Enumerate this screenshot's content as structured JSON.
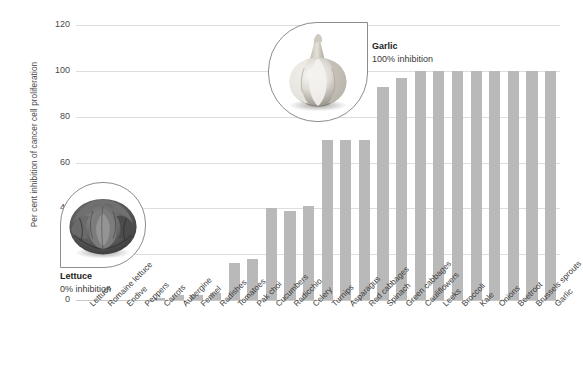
{
  "chart_data": {
    "type": "bar",
    "title": "",
    "xlabel": "",
    "ylabel": "Per cent inhibition of cancer cell proliferation",
    "ylim": [
      0,
      120
    ],
    "yticks": [
      0,
      20,
      40,
      60,
      80,
      100,
      120
    ],
    "grid": true,
    "legend": false,
    "bar_color": "#b9b9b9",
    "categories": [
      "Lettuce",
      "Romaine lettuce",
      "Endive",
      "Peppers",
      "Carrots",
      "Aubergine",
      "Fennel",
      "Radishes",
      "Tomatoes",
      "Pak choi",
      "Cucumbers",
      "Radicchio",
      "Celery",
      "Turnips",
      "Asparagus",
      "Red cabbages",
      "Spinach",
      "Green cabbages",
      "Cauliflowers",
      "Leeks",
      "Broccoli",
      "Kale",
      "Onions",
      "Beetroot",
      "Brussels sprouts",
      "Garlic"
    ],
    "values": [
      0,
      0,
      0,
      0,
      1,
      2,
      2,
      3,
      16,
      18,
      40,
      39,
      41,
      70,
      70,
      70,
      93,
      97,
      100,
      100,
      100,
      100,
      100,
      100,
      100,
      100
    ]
  },
  "annotations": {
    "garlic": {
      "name": "Garlic",
      "detail": "100% inhibition",
      "icon": "garlic-bulb-image"
    },
    "lettuce": {
      "name": "Lettuce",
      "detail": "0% inhibition",
      "icon": "lettuce-head-image"
    }
  }
}
